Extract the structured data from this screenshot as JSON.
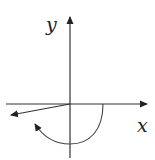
{
  "diagram": {
    "type": "angle-in-standard-position",
    "axes": {
      "x_label": "x",
      "y_label": "y"
    },
    "colors": {
      "stroke": "#333333",
      "background": "#ffffff"
    },
    "elements": [
      {
        "id": "x-axis",
        "kind": "arrow",
        "description": "horizontal axis with arrow at right"
      },
      {
        "id": "y-axis",
        "kind": "arrow",
        "description": "vertical axis with arrow at top"
      },
      {
        "id": "terminal-side",
        "kind": "ray",
        "description": "terminal side in third quadrant, slightly below negative x-axis"
      },
      {
        "id": "rotation-arc",
        "kind": "arc-arrow",
        "description": "clockwise rotation arc from positive x-axis through negative y-axis toward terminal side"
      }
    ]
  }
}
